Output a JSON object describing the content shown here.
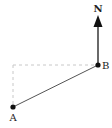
{
  "diagram": {
    "north_label": "N",
    "point_a_label": "A",
    "point_b_label": "B",
    "colors": {
      "line": "#555555",
      "arrow": "#444444",
      "dashed": "#c8c8c8",
      "point": "#111111",
      "text": "#222222"
    }
  }
}
